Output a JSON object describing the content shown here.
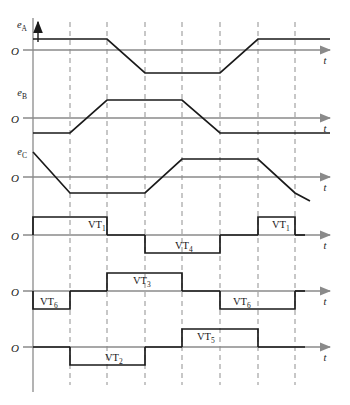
{
  "figure": {
    "background": "#ffffff",
    "wave_color": "#1a1a1a",
    "axis_color": "#8a8a8a",
    "grid_color": "#9a9a9a",
    "text_color": "#1a1a1a"
  },
  "geometry": {
    "x_origin": 33,
    "x_end": 330,
    "grid_x": [
      70,
      107,
      145,
      182,
      220,
      258,
      295
    ],
    "grid_top": 22,
    "grid_bottom": 385,
    "v_axis_top": 18,
    "v_axis_bottom": 392
  },
  "axes": {
    "t_label": "t",
    "zero_label": "O",
    "signals": [
      {
        "name": "e_A",
        "label": "e",
        "sub": "A",
        "zero_y": 50
      },
      {
        "name": "e_B",
        "label": "e",
        "sub": "B",
        "zero_y": 118
      },
      {
        "name": "e_C",
        "label": "e",
        "sub": "C",
        "zero_y": 177
      },
      {
        "name": "vt_row_1",
        "label": "",
        "sub": "",
        "zero_y": 235
      },
      {
        "name": "vt_row_2",
        "label": "",
        "sub": "",
        "zero_y": 291
      },
      {
        "name": "vt_row_3",
        "label": "",
        "sub": "",
        "zero_y": 347
      }
    ]
  },
  "chart_data": {
    "type": "line",
    "xlabel": "t",
    "grid": true,
    "emf_waveforms": [
      {
        "name": "e_A",
        "zero_y": 50,
        "high": 39,
        "low": 73,
        "points": "33,39 107,39 145,73 220,73 258,39 330,39",
        "description": "Phase A trapezoidal back-EMF: positive flat top through 2 intervals, ramp down, negative flat, ramp up"
      },
      {
        "name": "e_B",
        "zero_y": 118,
        "high": 100,
        "low": 133,
        "points": "33,133 70,133 107,100 182,100 220,133 295,133 330,133",
        "description": "Phase B trapezoidal back-EMF lagging phase A by 120 degrees"
      },
      {
        "name": "e_C",
        "zero_y": 177,
        "high": 159,
        "low": 193,
        "points": "33,152 70,193 145,193 182,159 258,159 295,193 310,201",
        "description": "Phase C trapezoidal back-EMF lagging phase B by 120 degrees"
      }
    ],
    "conduction_rows": [
      {
        "row": 1,
        "zero_y": 235,
        "amplitude": 18,
        "pulses": [
          {
            "label": "VT",
            "sub": "1",
            "x_start": 33,
            "x_end": 107,
            "polarity": "positive",
            "label_x": 88,
            "label_y": 228
          },
          {
            "label": "VT",
            "sub": "4",
            "x_start": 145,
            "x_end": 220,
            "polarity": "negative",
            "label_x": 175,
            "label_y": 249
          },
          {
            "label": "VT",
            "sub": "1",
            "x_start": 258,
            "x_end": 295,
            "polarity": "positive",
            "label_x": 272,
            "label_y": 228
          }
        ]
      },
      {
        "row": 2,
        "zero_y": 291,
        "amplitude": 18,
        "pulses": [
          {
            "label": "VT",
            "sub": "6",
            "x_start": 33,
            "x_end": 70,
            "polarity": "negative",
            "label_x": 40,
            "label_y": 305
          },
          {
            "label": "VT",
            "sub": "3",
            "x_start": 107,
            "x_end": 182,
            "polarity": "positive",
            "label_x": 133,
            "label_y": 284
          },
          {
            "label": "VT",
            "sub": "6",
            "x_start": 220,
            "x_end": 295,
            "polarity": "negative",
            "label_x": 233,
            "label_y": 305
          }
        ]
      },
      {
        "row": 3,
        "zero_y": 347,
        "amplitude": 18,
        "pulses": [
          {
            "label": "VT",
            "sub": "2",
            "x_start": 70,
            "x_end": 145,
            "polarity": "negative",
            "label_x": 105,
            "label_y": 361
          },
          {
            "label": "VT",
            "sub": "5",
            "x_start": 182,
            "x_end": 258,
            "polarity": "positive",
            "label_x": 197,
            "label_y": 340
          }
        ]
      }
    ]
  }
}
